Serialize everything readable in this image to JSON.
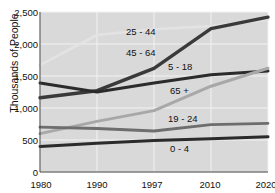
{
  "chart_data": {
    "type": "line",
    "title": "",
    "xlabel": "",
    "ylabel": "Thousands of People",
    "x": [
      1980,
      1990,
      1997,
      2010,
      2020
    ],
    "xtick_labels": [
      "1980",
      "1990",
      "1997",
      "2010",
      "2020"
    ],
    "ytick_labels": [
      "0",
      "500",
      "1,000",
      "1,500",
      "2,000",
      "2,500"
    ],
    "ytick_values": [
      0,
      500,
      1000,
      1500,
      2000,
      2500
    ],
    "ylim": [
      0,
      2500
    ],
    "grid": true,
    "legend_position": "inline-annotations",
    "plot_background": "#d9d9d9",
    "series": [
      {
        "name": "25 - 44",
        "label": "25 - 44",
        "color": "#e3e3e3",
        "width": 2.6,
        "values": [
          1670,
          2140,
          2230,
          2280,
          2380
        ]
      },
      {
        "name": "45 - 64",
        "label": "45 - 64",
        "color": "#3a3a3a",
        "width": 3.4,
        "values": [
          1160,
          1270,
          1620,
          2240,
          2420
        ]
      },
      {
        "name": "5 - 18",
        "label": "5 - 18",
        "color": "#2b2b2b",
        "width": 3.0,
        "values": [
          1390,
          1250,
          1390,
          1520,
          1580
        ]
      },
      {
        "name": "65 +",
        "label": "65 +",
        "color": "#a8a8a8",
        "width": 3.0,
        "values": [
          600,
          790,
          960,
          1340,
          1620
        ]
      },
      {
        "name": "19 - 24",
        "label": "19 - 24",
        "color": "#6e6e6e",
        "width": 2.8,
        "values": [
          700,
          680,
          640,
          740,
          760
        ]
      },
      {
        "name": "0 - 4",
        "label": "0 - 4",
        "color": "#2b2b2b",
        "width": 3.0,
        "values": [
          400,
          450,
          490,
          520,
          550
        ]
      }
    ],
    "annotations": [
      {
        "text": "25 - 44",
        "x_px": 126,
        "y_px": 31
      },
      {
        "text": "45 - 64",
        "x_px": 126,
        "y_px": 52
      },
      {
        "text": "5 - 18",
        "x_px": 168,
        "y_px": 66
      },
      {
        "text": "65 +",
        "x_px": 170,
        "y_px": 90
      },
      {
        "text": "19 - 24",
        "x_px": 168,
        "y_px": 118
      },
      {
        "text": "0 - 4",
        "x_px": 170,
        "y_px": 148
      }
    ]
  }
}
